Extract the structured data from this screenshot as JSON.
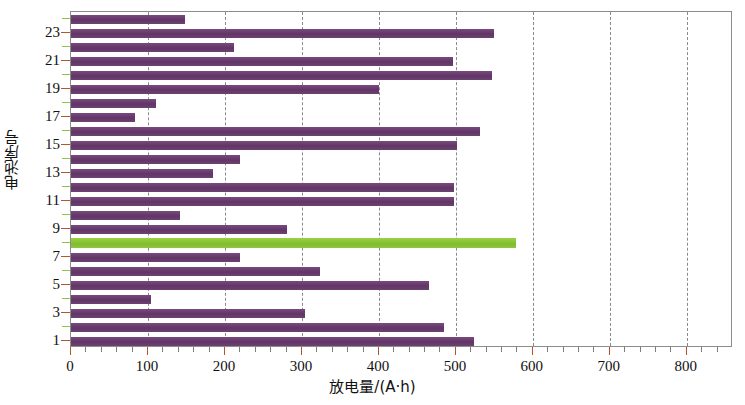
{
  "chart_data": {
    "type": "bar",
    "orientation": "horizontal",
    "title": "",
    "xlabel": "放电量/(A·h)",
    "ylabel": "电池序号",
    "xlim": [
      0,
      860
    ],
    "ylim": [
      0.5,
      24.5
    ],
    "grid": "vertical-dashed",
    "legend": null,
    "x_ticks": [
      0,
      100,
      200,
      300,
      400,
      500,
      600,
      700,
      800
    ],
    "x_tick_labels": [
      "0",
      "100",
      "200",
      "300",
      "400",
      "500",
      "600",
      "700",
      "800"
    ],
    "x_minor_tick_step": 20,
    "y_ticks": [
      1,
      3,
      5,
      7,
      9,
      11,
      13,
      15,
      17,
      19,
      21,
      23
    ],
    "y_tick_labels": [
      "1",
      "3",
      "5",
      "7",
      "9",
      "11",
      "13",
      "15",
      "17",
      "19",
      "21",
      "23"
    ],
    "categories": [
      1,
      2,
      3,
      4,
      5,
      6,
      7,
      8,
      9,
      10,
      11,
      12,
      13,
      14,
      15,
      16,
      17,
      18,
      19,
      20,
      21,
      22,
      23,
      24
    ],
    "values": [
      523,
      484,
      304,
      104,
      465,
      323,
      219,
      578,
      281,
      142,
      497,
      497,
      184,
      219,
      501,
      531,
      83,
      110,
      400,
      547,
      496,
      212,
      549,
      148
    ],
    "bar_color": "#6e3f72",
    "highlight_color": "#8dc63f",
    "highlight_category": 8
  },
  "axes": {
    "x_title": "放电量/(A·h)",
    "y_title": "电池序号"
  }
}
